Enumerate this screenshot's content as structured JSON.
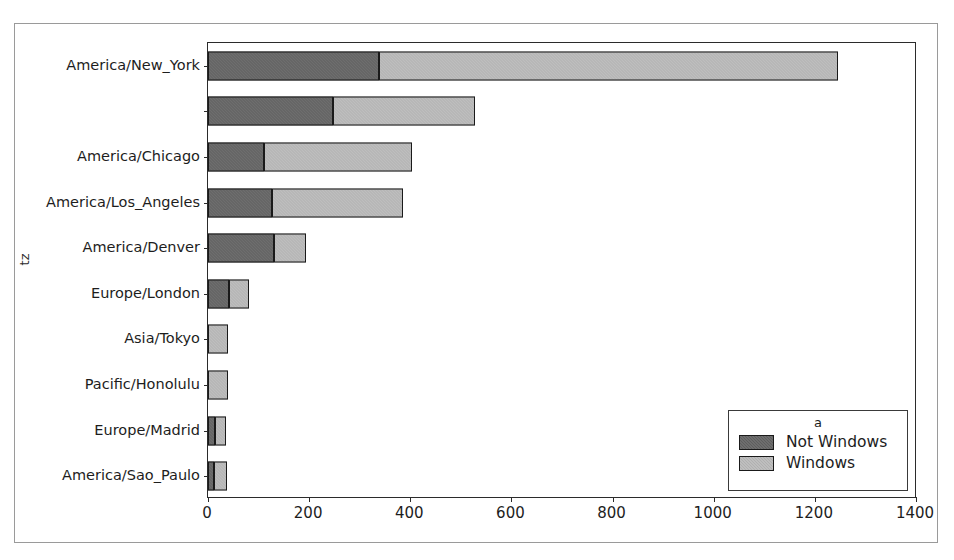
{
  "chart_data": {
    "type": "bar",
    "orientation": "horizontal",
    "stacked": true,
    "title": "",
    "xlabel": "",
    "ylabel": "tz",
    "xlim": [
      0,
      1400
    ],
    "xticks": [
      0,
      200,
      400,
      600,
      800,
      1000,
      1200,
      1400
    ],
    "xtick_labels": [
      "0",
      "200",
      "400",
      "600",
      "800",
      "1000",
      "1200",
      "1400"
    ],
    "grid": false,
    "categories": [
      "America/New_York",
      "",
      "America/Chicago",
      "America/Los_Angeles",
      "America/Denver",
      "Europe/London",
      "Asia/Tokyo",
      "Pacific/Honolulu",
      "Europe/Madrid",
      "America/Sao_Paulo"
    ],
    "legend": {
      "title": "a",
      "position": "lower right",
      "entries": [
        "Not Windows",
        "Windows"
      ]
    },
    "series": [
      {
        "name": "Not Windows",
        "color": "#5e5e5e",
        "values": [
          339,
          247,
          111,
          127,
          131,
          42,
          0,
          0,
          14,
          12
        ]
      },
      {
        "name": "Windows",
        "color": "#b0b0b0",
        "values": [
          906,
          280,
          293,
          259,
          63,
          39,
          40,
          39,
          22,
          25
        ]
      }
    ],
    "totals": [
      1245,
      527,
      404,
      386,
      194,
      81,
      40,
      39,
      36,
      37
    ]
  },
  "colors": {
    "not_windows": "#5e5e5e",
    "windows": "#b0b0b0",
    "axis": "#2b2b2b",
    "figure_border": "#9a9a9a",
    "background": "#ffffff"
  }
}
